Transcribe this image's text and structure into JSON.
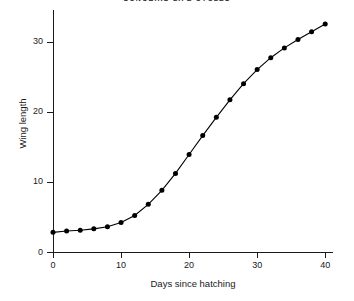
{
  "chart_data": {
    "type": "line",
    "title": "SONGBIRD LIFE CYCLES",
    "xlabel": "Days since hatching",
    "ylabel": "Wing length",
    "xlim": [
      0,
      41
    ],
    "ylim": [
      0,
      34.5
    ],
    "xticks": [
      0,
      10,
      20,
      30,
      40
    ],
    "yticks": [
      0,
      10,
      20,
      30
    ],
    "grid": false,
    "legend": false,
    "marker": "filled-circle",
    "x": [
      0,
      2,
      4,
      6,
      8,
      10,
      12,
      14,
      16,
      18,
      20,
      22,
      24,
      26,
      28,
      30,
      32,
      34,
      36,
      38,
      40
    ],
    "values": [
      2.8,
      3.0,
      3.1,
      3.3,
      3.6,
      4.2,
      5.2,
      6.8,
      8.8,
      11.2,
      13.9,
      16.6,
      19.2,
      21.7,
      24.0,
      26.0,
      27.7,
      29.1,
      30.3,
      31.4,
      32.5
    ],
    "series": [
      {
        "name": "Wing length",
        "values": [
          2.8,
          3.0,
          3.1,
          3.3,
          3.6,
          4.2,
          5.2,
          6.8,
          8.8,
          11.2,
          13.9,
          16.6,
          19.2,
          21.7,
          24.0,
          26.0,
          27.7,
          29.1,
          30.3,
          31.4,
          32.5
        ]
      }
    ]
  },
  "colors": {
    "axis": "#1a1a1a",
    "line": "#000000",
    "marker": "#000000",
    "background": "#ffffff"
  }
}
